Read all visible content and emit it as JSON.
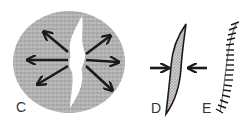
{
  "panels": [
    {
      "id": "C",
      "label": "C",
      "description": "stippled ellipse with central white cleft and outward-pointing arrows"
    },
    {
      "id": "D",
      "label": "D",
      "description": "stippled crescent with two inward-pointing arrows"
    },
    {
      "id": "E",
      "label": "E",
      "description": "curved arc with hatch marks"
    }
  ],
  "colors": {
    "stipple": "#a8a8a8",
    "ink": "#1a1a1a",
    "background": "#ffffff"
  }
}
